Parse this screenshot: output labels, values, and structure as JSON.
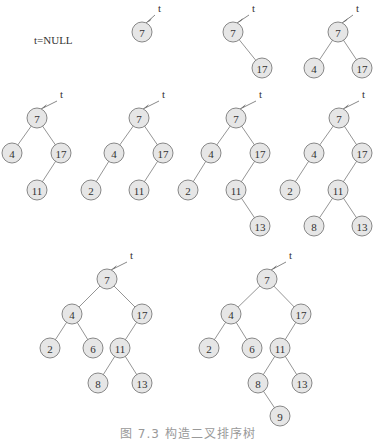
{
  "null_label": "t=NULL",
  "pointer_label": "t",
  "caption": "图 7.3  构造二叉排序树",
  "colors": {
    "node_fill": "#e6e6e6",
    "node_stroke": "#7a7a7a",
    "edge": "#7a7a7a"
  },
  "trees": [
    {
      "name": "step-1",
      "root": [
        142,
        32
      ],
      "t": [
        158,
        12
      ],
      "nodes": [
        {
          "v": "7",
          "x": 142,
          "y": 32
        }
      ],
      "edges": []
    },
    {
      "name": "step-2",
      "root": [
        233,
        32
      ],
      "t": [
        252,
        12
      ],
      "nodes": [
        {
          "v": "7",
          "x": 233,
          "y": 32
        },
        {
          "v": "17",
          "x": 262,
          "y": 68
        }
      ],
      "edges": [
        [
          0,
          1
        ]
      ]
    },
    {
      "name": "step-3",
      "root": [
        338,
        32
      ],
      "t": [
        356,
        12
      ],
      "nodes": [
        {
          "v": "7",
          "x": 338,
          "y": 32
        },
        {
          "v": "4",
          "x": 314,
          "y": 68
        },
        {
          "v": "17",
          "x": 362,
          "y": 68
        }
      ],
      "edges": [
        [
          0,
          1
        ],
        [
          0,
          2
        ]
      ]
    },
    {
      "name": "step-4",
      "root": [
        37,
        118
      ],
      "t": [
        60,
        98
      ],
      "nodes": [
        {
          "v": "7",
          "x": 37,
          "y": 118
        },
        {
          "v": "4",
          "x": 12,
          "y": 153
        },
        {
          "v": "17",
          "x": 61,
          "y": 153
        },
        {
          "v": "11",
          "x": 37,
          "y": 190
        }
      ],
      "edges": [
        [
          0,
          1
        ],
        [
          0,
          2
        ],
        [
          2,
          3
        ]
      ]
    },
    {
      "name": "step-5",
      "root": [
        139,
        118
      ],
      "t": [
        162,
        98
      ],
      "nodes": [
        {
          "v": "7",
          "x": 139,
          "y": 118
        },
        {
          "v": "4",
          "x": 114,
          "y": 153
        },
        {
          "v": "17",
          "x": 163,
          "y": 153
        },
        {
          "v": "2",
          "x": 91,
          "y": 190
        },
        {
          "v": "11",
          "x": 139,
          "y": 190
        }
      ],
      "edges": [
        [
          0,
          1
        ],
        [
          0,
          2
        ],
        [
          1,
          3
        ],
        [
          2,
          4
        ]
      ]
    },
    {
      "name": "step-6",
      "root": [
        236,
        118
      ],
      "t": [
        259,
        98
      ],
      "nodes": [
        {
          "v": "7",
          "x": 236,
          "y": 118
        },
        {
          "v": "4",
          "x": 211,
          "y": 153
        },
        {
          "v": "17",
          "x": 260,
          "y": 153
        },
        {
          "v": "2",
          "x": 188,
          "y": 190
        },
        {
          "v": "11",
          "x": 236,
          "y": 190
        },
        {
          "v": "13",
          "x": 260,
          "y": 226
        }
      ],
      "edges": [
        [
          0,
          1
        ],
        [
          0,
          2
        ],
        [
          1,
          3
        ],
        [
          2,
          4
        ],
        [
          4,
          5
        ]
      ]
    },
    {
      "name": "step-7",
      "root": [
        339,
        118
      ],
      "t": [
        362,
        98
      ],
      "nodes": [
        {
          "v": "7",
          "x": 339,
          "y": 118
        },
        {
          "v": "4",
          "x": 314,
          "y": 153
        },
        {
          "v": "17",
          "x": 362,
          "y": 153
        },
        {
          "v": "2",
          "x": 290,
          "y": 190
        },
        {
          "v": "11",
          "x": 338,
          "y": 190
        },
        {
          "v": "8",
          "x": 314,
          "y": 226
        },
        {
          "v": "13",
          "x": 362,
          "y": 226
        }
      ],
      "edges": [
        [
          0,
          1
        ],
        [
          0,
          2
        ],
        [
          1,
          3
        ],
        [
          2,
          4
        ],
        [
          4,
          5
        ],
        [
          4,
          6
        ]
      ]
    },
    {
      "name": "step-8",
      "root": [
        107,
        279
      ],
      "t": [
        130,
        259
      ],
      "nodes": [
        {
          "v": "7",
          "x": 107,
          "y": 279
        },
        {
          "v": "4",
          "x": 72,
          "y": 314
        },
        {
          "v": "17",
          "x": 142,
          "y": 314
        },
        {
          "v": "2",
          "x": 50,
          "y": 348
        },
        {
          "v": "6",
          "x": 93,
          "y": 348
        },
        {
          "v": "11",
          "x": 120,
          "y": 348
        },
        {
          "v": "8",
          "x": 98,
          "y": 383
        },
        {
          "v": "13",
          "x": 142,
          "y": 383
        }
      ],
      "edges": [
        [
          0,
          1
        ],
        [
          0,
          2
        ],
        [
          1,
          3
        ],
        [
          1,
          4
        ],
        [
          2,
          5
        ],
        [
          5,
          6
        ],
        [
          5,
          7
        ]
      ]
    },
    {
      "name": "step-9",
      "root": [
        267,
        279
      ],
      "t": [
        289,
        259
      ],
      "nodes": [
        {
          "v": "7",
          "x": 267,
          "y": 279
        },
        {
          "v": "4",
          "x": 231,
          "y": 314
        },
        {
          "v": "17",
          "x": 301,
          "y": 314
        },
        {
          "v": "2",
          "x": 209,
          "y": 348
        },
        {
          "v": "6",
          "x": 252,
          "y": 348
        },
        {
          "v": "11",
          "x": 280,
          "y": 348
        },
        {
          "v": "8",
          "x": 258,
          "y": 383
        },
        {
          "v": "13",
          "x": 302,
          "y": 383
        },
        {
          "v": "9",
          "x": 280,
          "y": 416
        }
      ],
      "edges": [
        [
          0,
          1
        ],
        [
          0,
          2
        ],
        [
          1,
          3
        ],
        [
          1,
          4
        ],
        [
          2,
          5
        ],
        [
          5,
          6
        ],
        [
          5,
          7
        ],
        [
          6,
          8
        ]
      ]
    }
  ]
}
